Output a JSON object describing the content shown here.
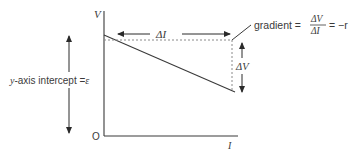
{
  "diagram": {
    "axes": {
      "y_label": "V",
      "x_label": "I",
      "origin_label": "O"
    },
    "annotations": {
      "delta_i": "ΔI",
      "delta_v": "ΔV",
      "gradient_prefix": "gradient =",
      "gradient_num": "ΔV",
      "gradient_den": "ΔI",
      "gradient_suffix": "= −r",
      "intercept_prefix": "y",
      "intercept_text": "-axis intercept =",
      "intercept_symbol": "ε"
    },
    "line": {
      "description": "straight line with negative slope",
      "slope_symbol": "-r",
      "intercept_symbol": "ε"
    },
    "colors": {
      "ink": "#3a3a3a",
      "dashed": "#8a8a8a",
      "background": "#ffffff"
    }
  }
}
